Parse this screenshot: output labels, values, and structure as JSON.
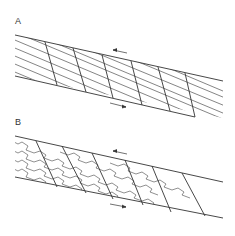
{
  "figure": {
    "panels": [
      {
        "label": "A",
        "description": "Shear zone with straight oblique layering cut by antithetic faults"
      },
      {
        "label": "B",
        "description": "Shear zone with folded/crenulated layering cut by antithetic faults"
      }
    ],
    "shear_sense": "sinistral (top-left arrow, bottom-right arrow)"
  }
}
